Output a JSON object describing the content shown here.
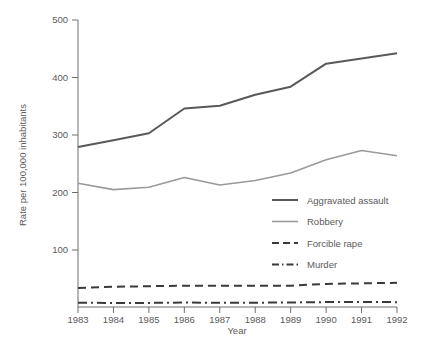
{
  "chart_data": {
    "type": "line",
    "title": "",
    "xlabel": "Year",
    "ylabel": "Rate per 100,000 inhabitants",
    "x": [
      1983,
      1984,
      1985,
      1986,
      1987,
      1988,
      1989,
      1990,
      1991,
      1992
    ],
    "categories": [
      "1983",
      "1984",
      "1985",
      "1986",
      "1987",
      "1988",
      "1989",
      "1990",
      "1991",
      "1992"
    ],
    "xlim": [
      1983,
      1992
    ],
    "ylim": [
      0,
      500
    ],
    "yticks": [
      100,
      200,
      300,
      400,
      500
    ],
    "ytick_labels": [
      "100",
      "200",
      "300",
      "400",
      "500"
    ],
    "grid": false,
    "legend_position": "center-right",
    "series": [
      {
        "name": "Aggravated assault",
        "style": "solid",
        "color": "#595959",
        "width": 2,
        "values": [
          279,
          291,
          303,
          346,
          351,
          370,
          384,
          424,
          433,
          442
        ]
      },
      {
        "name": "Robbery",
        "style": "solid",
        "color": "#9a9a9a",
        "width": 1.6,
        "values": [
          216,
          205,
          209,
          226,
          213,
          221,
          234,
          257,
          273,
          264
        ]
      },
      {
        "name": "Forcible rape",
        "style": "dashed",
        "color": "#3a3a3a",
        "width": 2,
        "values": [
          34,
          36,
          37,
          38,
          38,
          38,
          38,
          41,
          42,
          43
        ]
      },
      {
        "name": "Murder",
        "style": "dashdot",
        "color": "#3a3a3a",
        "width": 2,
        "values": [
          8.3,
          7.9,
          8.0,
          8.6,
          8.3,
          8.4,
          8.7,
          9.4,
          9.8,
          9.3
        ]
      }
    ]
  },
  "legend": {
    "items": [
      {
        "label": "Aggravated assault"
      },
      {
        "label": "Robbery"
      },
      {
        "label": "Forcible rape"
      },
      {
        "label": "Murder"
      }
    ]
  }
}
